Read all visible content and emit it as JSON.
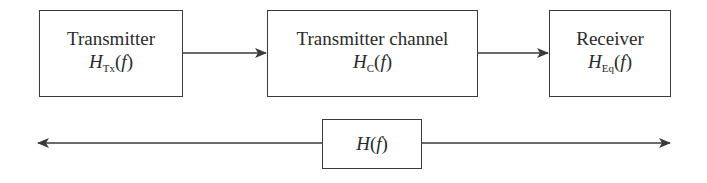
{
  "blocks": [
    {
      "title": "Transmitter",
      "symbol": "H",
      "subscript": "Tx",
      "arg": "f"
    },
    {
      "title": "Transmitter channel",
      "symbol": "H",
      "subscript": "C",
      "arg": "f"
    },
    {
      "title": "Receiver",
      "symbol": "H",
      "subscript": "Eq",
      "arg": "f"
    }
  ],
  "overall": {
    "symbol": "H",
    "arg": "f"
  },
  "colors": {
    "line": "#3a3a3a",
    "text": "#2a2a2a"
  }
}
